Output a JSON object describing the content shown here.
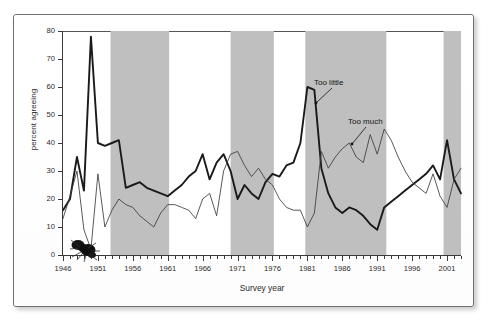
{
  "figure": {
    "y_axis_title": "percent agreeing",
    "x_axis_title": "Survey year"
  },
  "annotations": {
    "too_little": "Too little",
    "too_much": "Too much"
  },
  "chart_data": {
    "type": "line",
    "title": "",
    "xlabel": "Survey year",
    "ylabel": "percent agreeing",
    "xlim": [
      1946,
      2003
    ],
    "ylim": [
      0,
      80
    ],
    "yticks": [
      0,
      10,
      20,
      30,
      40,
      50,
      60,
      70,
      80
    ],
    "xticks": [
      1946,
      1951,
      1956,
      1961,
      1966,
      1971,
      1976,
      1981,
      1986,
      1991,
      1996,
      2001
    ],
    "xtick_labels": [
      "1946",
      "1951",
      "1956",
      "1961",
      "1966",
      "1971",
      "1976",
      "1981",
      "1986",
      "1991",
      "1996",
      "2001"
    ],
    "grid": false,
    "legend": "inline-annotations",
    "shaded_bands": {
      "label": "alternating shaded year ranges",
      "color": "#bfbfbf",
      "ranges": [
        [
          1952.8,
          1961.2
        ],
        [
          1970.0,
          1976.2
        ],
        [
          1980.7,
          1992.3
        ],
        [
          2000.5,
          2003.0
        ]
      ]
    },
    "series": [
      {
        "name": "Too little",
        "style": "thick-black",
        "color": "#1a1a1a",
        "x": [
          1946,
          1947,
          1948,
          1949,
          1950,
          1951,
          1952,
          1953,
          1954,
          1955,
          1956,
          1957,
          1958,
          1959,
          1960,
          1961,
          1962,
          1963,
          1964,
          1965,
          1966,
          1967,
          1968,
          1969,
          1970,
          1971,
          1972,
          1973,
          1974,
          1975,
          1976,
          1977,
          1978,
          1979,
          1980,
          1981,
          1982,
          1983,
          1984,
          1985,
          1986,
          1987,
          1988,
          1989,
          1990,
          1991,
          1992,
          1993,
          1994,
          1995,
          1996,
          1997,
          1998,
          1999,
          2000,
          2001,
          2002,
          2003
        ],
        "y": [
          16,
          20,
          35,
          23,
          78,
          40,
          39,
          40,
          41,
          24,
          25,
          26,
          24,
          23,
          22,
          21,
          23,
          25,
          28,
          30,
          36,
          27,
          33,
          36,
          30,
          20,
          25,
          22,
          20,
          26,
          29,
          28,
          32,
          33,
          40,
          60,
          59,
          31,
          22,
          17,
          15,
          17,
          16,
          14,
          11,
          9,
          17,
          19,
          21,
          23,
          25,
          27,
          29,
          32,
          27,
          41,
          27,
          22
        ]
      },
      {
        "name": "Too much",
        "style": "thin-black",
        "color": "#3c3c3c",
        "x": [
          1946,
          1947,
          1948,
          1949,
          1950,
          1951,
          1952,
          1953,
          1954,
          1955,
          1956,
          1957,
          1958,
          1959,
          1960,
          1961,
          1962,
          1963,
          1964,
          1965,
          1966,
          1967,
          1968,
          1969,
          1970,
          1971,
          1972,
          1973,
          1974,
          1975,
          1976,
          1977,
          1978,
          1979,
          1980,
          1981,
          1982,
          1983,
          1984,
          1985,
          1986,
          1987,
          1988,
          1989,
          1990,
          1991,
          1992,
          1993,
          1994,
          1995,
          1996,
          1997,
          1998,
          1999,
          2000,
          2001,
          2002,
          2003
        ],
        "y": [
          13,
          21,
          30,
          9,
          2,
          29,
          10,
          16,
          20,
          18,
          17,
          14,
          12,
          10,
          15,
          18,
          18,
          17,
          16,
          13,
          20,
          22,
          14,
          30,
          36,
          37,
          32,
          28,
          31,
          27,
          25,
          20,
          17,
          16,
          16,
          10,
          15,
          37,
          31,
          35,
          38,
          40,
          35,
          33,
          43,
          36,
          45,
          41,
          35,
          30,
          26,
          24,
          22,
          29,
          21,
          17,
          27,
          31
        ]
      }
    ],
    "annotations": [
      {
        "text": "Too little",
        "points_to_series": "Too little",
        "near_year": 1981
      },
      {
        "text": "Too much",
        "points_to_series": "Too much",
        "near_year": 1987
      }
    ]
  }
}
